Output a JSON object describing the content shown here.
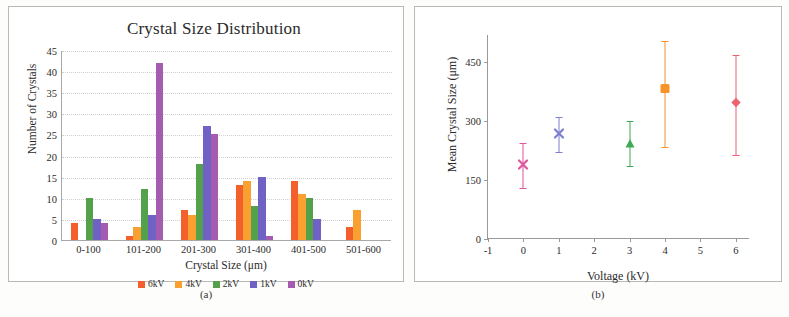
{
  "figure": {
    "caption_a": "(a)",
    "caption_b": "(b)"
  },
  "chart_data": [
    {
      "type": "bar",
      "panel": "a",
      "title": "Crystal Size Distribution",
      "xlabel": "Crystal Size (μm)",
      "ylabel": "Number of Crystals",
      "categories": [
        "0-100",
        "101-200",
        "201-300",
        "301-400",
        "401-500",
        "501-600"
      ],
      "ylim": [
        0,
        45
      ],
      "yticks": [
        0,
        5,
        10,
        15,
        20,
        25,
        30,
        35,
        40,
        45
      ],
      "grid": true,
      "legend_position": "bottom",
      "series": [
        {
          "name": "6kV",
          "color": "#f4602c",
          "values": [
            4,
            1,
            7,
            13,
            14,
            3
          ]
        },
        {
          "name": "4kV",
          "color": "#f9a030",
          "values": [
            0,
            3,
            6,
            14,
            11,
            7
          ]
        },
        {
          "name": "2kV",
          "color": "#54a14c",
          "values": [
            10,
            12,
            18,
            8,
            10,
            0
          ]
        },
        {
          "name": "1kV",
          "color": "#6f62c4",
          "values": [
            5,
            6,
            27,
            15,
            5,
            0
          ]
        },
        {
          "name": "0kV",
          "color": "#a45bb0",
          "values": [
            4,
            42,
            25,
            1,
            0,
            0
          ]
        }
      ]
    },
    {
      "type": "scatter",
      "panel": "b",
      "title": "",
      "xlabel": "Voltage (kV)",
      "ylabel": "Mean Crystal Size (μm)",
      "xlim": [
        -1,
        6.4
      ],
      "ylim": [
        0,
        520
      ],
      "xticks": [
        -1,
        0,
        1,
        2,
        3,
        4,
        5,
        6
      ],
      "yticks": [
        0,
        150,
        300,
        450
      ],
      "grid": false,
      "points": [
        {
          "x": 0,
          "y": 185,
          "err_low": 55,
          "err_high": 60,
          "color": "#e0559b",
          "marker": "x",
          "label": "0 kV"
        },
        {
          "x": 1,
          "y": 265,
          "err_low": 42,
          "err_high": 46,
          "color": "#7b7fd0",
          "marker": "x",
          "label": "1 kV"
        },
        {
          "x": 3,
          "y": 240,
          "err_low": 55,
          "err_high": 62,
          "color": "#3faa55",
          "marker": "triangle",
          "label": "3 kV"
        },
        {
          "x": 4,
          "y": 380,
          "err_low": 145,
          "err_high": 125,
          "color": "#f79328",
          "marker": "square",
          "label": "4 kV"
        },
        {
          "x": 6,
          "y": 345,
          "err_low": 130,
          "err_high": 125,
          "color": "#ef6071",
          "marker": "diamond",
          "label": "6 kV"
        }
      ]
    }
  ]
}
